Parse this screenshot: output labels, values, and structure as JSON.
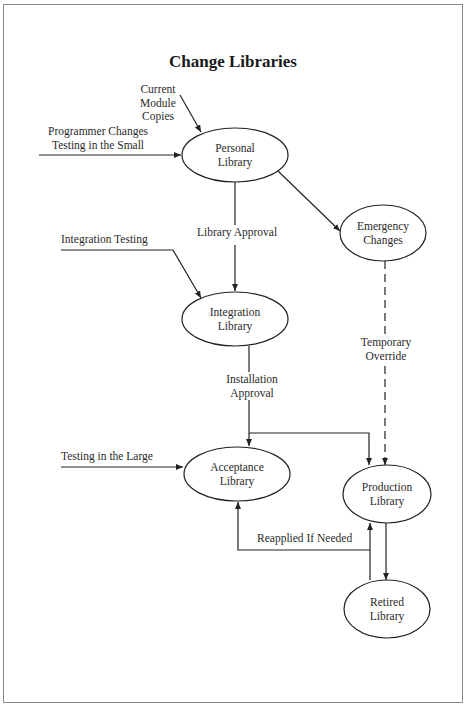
{
  "title": "Change Libraries",
  "nodes": {
    "personal": {
      "line1": "Personal",
      "line2": "Library"
    },
    "emergency": {
      "line1": "Emergency",
      "line2": "Changes"
    },
    "integration": {
      "line1": "Integration",
      "line2": "Library"
    },
    "acceptance": {
      "line1": "Acceptance",
      "line2": "Library"
    },
    "production": {
      "line1": "Production",
      "line2": "Library"
    },
    "retired": {
      "line1": "Retired",
      "line2": "Library"
    }
  },
  "inputs": {
    "current_module": {
      "line1": "Current",
      "line2": "Module",
      "line3": "Copies"
    },
    "programmer": {
      "line1": "Programmer Changes",
      "line2": "Testing in the Small"
    },
    "integration_testing": "Integration Testing",
    "testing_large": "Testing in the Large"
  },
  "edges": {
    "library_approval": "Library Approval",
    "installation_approval": {
      "line1": "Installation",
      "line2": "Approval"
    },
    "temporary_override": {
      "line1": "Temporary",
      "line2": "Override"
    },
    "reapplied": "Reapplied If Needed"
  }
}
